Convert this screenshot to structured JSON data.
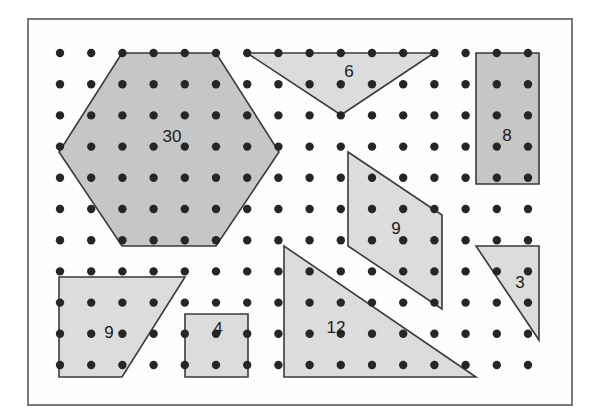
{
  "figure": {
    "type": "geoboard-dot-grid",
    "canvas": {
      "width": 597,
      "height": 419
    },
    "background_color": "#ffffff",
    "frame": {
      "x": 27,
      "y": 18,
      "width": 546,
      "height": 388,
      "stroke": "#7a7a7a",
      "stroke_width": 2,
      "fill": "#fdfdfd"
    },
    "grid": {
      "origin_x": 60,
      "origin_y": 53,
      "spacing": 31.2,
      "cols": 16,
      "rows": 11,
      "dot_radius": 4.2,
      "dot_color": "#262626"
    },
    "styles": {
      "outline_color": "#3a3a3a",
      "outline_width": 1.6,
      "fill_light": "#dcdcdc",
      "fill_dark": "#c6c6c6",
      "label_color": "#1a1a1a",
      "label_font_size": 17
    },
    "shapes": [
      {
        "name": "hexagon",
        "label": "30",
        "label_x": 172,
        "label_y": 138,
        "fill": "#c6c6c6",
        "points": "122,53 216,53 279,152 216,246 122,246 59,152"
      },
      {
        "name": "inverted-triangle",
        "label": "6",
        "label_x": 349,
        "label_y": 73,
        "fill": "#dcdcdc",
        "points": "247,53 434,53 341,115"
      },
      {
        "name": "rectangle",
        "label": "8",
        "label_x": 507,
        "label_y": 137,
        "fill": "#c6c6c6",
        "points": "476,53 539,53 539,184 476,184"
      },
      {
        "name": "parallelogram",
        "label": "9",
        "label_x": 396,
        "label_y": 230,
        "fill": "#dcdcdc",
        "points": "348,152 442,215 442,309 348,246"
      },
      {
        "name": "right-triangle-large",
        "label": "12",
        "label_x": 336,
        "label_y": 329,
        "fill": "#dcdcdc",
        "points": "284,246 284,377 476,377"
      },
      {
        "name": "trapezoid",
        "label": "9",
        "label_x": 109,
        "label_y": 334,
        "fill": "#dcdcdc",
        "points": "59,277 185,277 122,377 59,377"
      },
      {
        "name": "square",
        "label": "4",
        "label_x": 218,
        "label_y": 330,
        "fill": "#dcdcdc",
        "points": "185,314 248,314 248,377 185,377"
      },
      {
        "name": "right-triangle-small",
        "label": "3",
        "label_x": 520,
        "label_y": 284,
        "fill": "#dcdcdc",
        "points": "476,246 539,246 539,340"
      }
    ]
  }
}
